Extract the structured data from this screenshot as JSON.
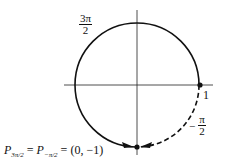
{
  "diagram": {
    "circle": {
      "cx": 137,
      "cy": 85,
      "r": 62
    },
    "labels": {
      "three_pi_over_2": {
        "numerator": "3π",
        "denominator": "2"
      },
      "one": "1",
      "neg_pi_over_2": {
        "sign": "−",
        "numerator": "π",
        "denominator": "2"
      },
      "equation": {
        "p1": "P",
        "p1_sub": "3π/2",
        "eq1": " = ",
        "p2": "P",
        "p2_sub": "−π/2",
        "eq2": " = ",
        "point": "(0, −1)"
      }
    },
    "colors": {
      "stroke": "#111111",
      "background": "#ffffff"
    }
  }
}
